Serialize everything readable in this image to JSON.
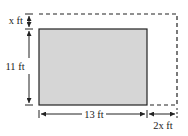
{
  "diagram": {
    "labels": {
      "top_extension": "x ft",
      "height": "11 ft",
      "width": "13 ft",
      "right_extension": "2x ft"
    },
    "colors": {
      "fill": "#d6d6d6",
      "stroke": "#222222",
      "background": "#ffffff"
    }
  }
}
